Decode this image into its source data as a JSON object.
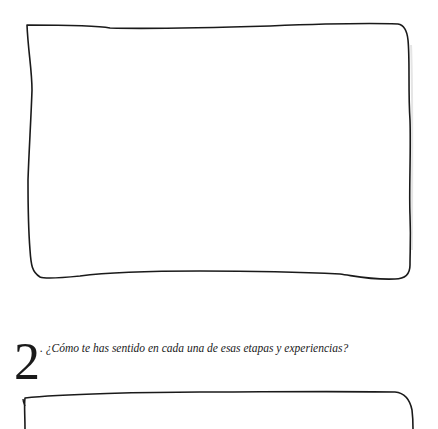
{
  "question2": {
    "number": "2",
    "text": ". ¿Cómo te has sentido en cada una de esas etapas y experiencias?"
  },
  "colors": {
    "ink": "#1a1a1a",
    "background": "#ffffff"
  }
}
